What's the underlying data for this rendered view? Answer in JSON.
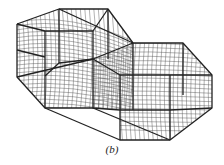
{
  "figure": {
    "caption": "(b)",
    "colors": {
      "frame": "#222222",
      "mesh": "#555555",
      "background": "#ffffff"
    },
    "left_prism": {
      "outline": [
        [
          17,
          24
        ],
        [
          59,
          9
        ],
        [
          108,
          9
        ],
        [
          133,
          43
        ],
        [
          133,
          63
        ],
        [
          93,
          59
        ],
        [
          93,
          108
        ],
        [
          45,
          108
        ],
        [
          17,
          77
        ]
      ],
      "inner_edges": [
        [
          [
            17,
            24
          ],
          [
            45,
            31
          ]
        ],
        [
          [
            45,
            31
          ],
          [
            45,
            108
          ]
        ],
        [
          [
            45,
            31
          ],
          [
            93,
            31
          ]
        ],
        [
          [
            59,
            9
          ],
          [
            59,
            63
          ]
        ],
        [
          [
            17,
            50
          ],
          [
            45,
            57
          ]
        ]
      ]
    },
    "right_prism": {
      "outline": [
        [
          93,
          59
        ],
        [
          133,
          43
        ],
        [
          183,
          43
        ],
        [
          212,
          75
        ],
        [
          212,
          108
        ],
        [
          170,
          140
        ],
        [
          120,
          140
        ],
        [
          120,
          110
        ],
        [
          93,
          108
        ]
      ],
      "inner_edges": [
        [
          [
            133,
            43
          ],
          [
            133,
            110
          ]
        ],
        [
          [
            183,
            43
          ],
          [
            183,
            110
          ]
        ],
        [
          [
            93,
            59
          ],
          [
            170,
            75
          ]
        ],
        [
          [
            170,
            75
          ],
          [
            212,
            75
          ]
        ],
        [
          [
            170,
            75
          ],
          [
            170,
            140
          ]
        ],
        [
          [
            120,
            110
          ],
          [
            170,
            110
          ]
        ]
      ]
    }
  }
}
